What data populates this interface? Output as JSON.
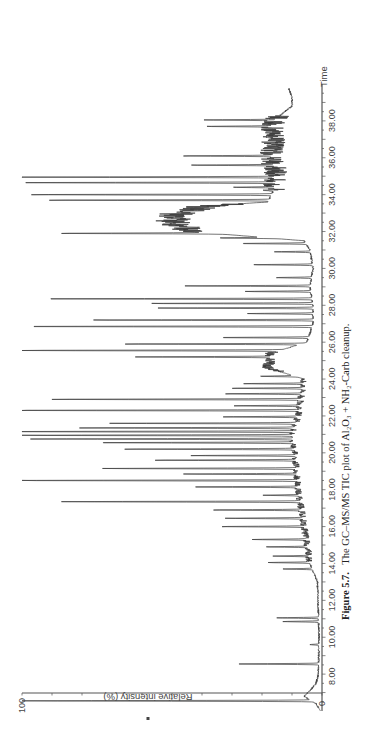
{
  "figure": {
    "caption_label": "Figure 5.7.",
    "caption_text": "The GC–MS/MS TIC plot of Al₂O₃ + NH₂-Carb cleanup."
  },
  "chart_data": {
    "type": "line",
    "xlabel": "Time",
    "ylabel": "Relative intensity (%)",
    "orientation": "rotated 90° counter-clockwise (time axis vertical, increasing upward; intensity increasing leftward)",
    "xlim": [
      6.0,
      40.0
    ],
    "ylim": [
      0,
      100
    ],
    "x_ticks": [
      "8.00",
      "10.00",
      "12.00",
      "14.00",
      "16.00",
      "18.00",
      "20.00",
      "22.00",
      "24.00",
      "26.00",
      "28.00",
      "30.00",
      "32.00",
      "34.00",
      "36.00",
      "38.00"
    ],
    "y_ticks": [
      "0",
      "100"
    ],
    "grid": false,
    "legend": null,
    "peaks": [
      {
        "t": 6.55,
        "h": 99
      },
      {
        "t": 8.55,
        "h": 28
      },
      {
        "t": 9.6,
        "h": 3
      },
      {
        "t": 10.85,
        "h": 12
      },
      {
        "t": 11.05,
        "h": 14
      },
      {
        "t": 13.7,
        "h": 10
      },
      {
        "t": 14.05,
        "h": 14
      },
      {
        "t": 14.4,
        "h": 12
      },
      {
        "t": 14.9,
        "h": 14
      },
      {
        "t": 15.3,
        "h": 18
      },
      {
        "t": 16.0,
        "h": 28
      },
      {
        "t": 16.45,
        "h": 26
      },
      {
        "t": 16.9,
        "h": 30
      },
      {
        "t": 17.35,
        "h": 80
      },
      {
        "t": 17.7,
        "h": 12
      },
      {
        "t": 18.15,
        "h": 36
      },
      {
        "t": 18.5,
        "h": 96
      },
      {
        "t": 18.85,
        "h": 38
      },
      {
        "t": 19.15,
        "h": 65
      },
      {
        "t": 19.6,
        "h": 48
      },
      {
        "t": 19.85,
        "h": 35
      },
      {
        "t": 20.2,
        "h": 58
      },
      {
        "t": 20.55,
        "h": 67
      },
      {
        "t": 20.75,
        "h": 88
      },
      {
        "t": 20.95,
        "h": 95
      },
      {
        "t": 21.15,
        "h": 100
      },
      {
        "t": 21.35,
        "h": 72
      },
      {
        "t": 21.6,
        "h": 62
      },
      {
        "t": 21.95,
        "h": 25
      },
      {
        "t": 22.3,
        "h": 100
      },
      {
        "t": 22.55,
        "h": 22
      },
      {
        "t": 22.9,
        "h": 85
      },
      {
        "t": 23.2,
        "h": 26
      },
      {
        "t": 23.5,
        "h": 24
      },
      {
        "t": 23.75,
        "h": 20
      },
      {
        "t": 24.15,
        "h": 12
      },
      {
        "t": 25.2,
        "h": 45
      },
      {
        "t": 25.55,
        "h": 92
      },
      {
        "t": 25.9,
        "h": 60
      },
      {
        "t": 26.25,
        "h": 30
      },
      {
        "t": 26.85,
        "h": 98
      },
      {
        "t": 27.2,
        "h": 75
      },
      {
        "t": 27.55,
        "h": 22
      },
      {
        "t": 27.85,
        "h": 52
      },
      {
        "t": 28.1,
        "h": 55
      },
      {
        "t": 28.35,
        "h": 92
      },
      {
        "t": 28.75,
        "h": 22
      },
      {
        "t": 29.05,
        "h": 42
      },
      {
        "t": 29.5,
        "h": 12
      },
      {
        "t": 30.2,
        "h": 20
      },
      {
        "t": 30.9,
        "h": 12
      },
      {
        "t": 31.35,
        "h": 22
      },
      {
        "t": 31.65,
        "h": 17
      },
      {
        "t": 31.9,
        "h": 52
      },
      {
        "t": 33.7,
        "h": 75
      },
      {
        "t": 34.0,
        "h": 82
      },
      {
        "t": 34.4,
        "h": 14
      },
      {
        "t": 34.65,
        "h": 88
      },
      {
        "t": 34.95,
        "h": 92
      },
      {
        "t": 35.6,
        "h": 28
      },
      {
        "t": 36.1,
        "h": 30
      },
      {
        "t": 37.7,
        "h": 22
      },
      {
        "t": 38.05,
        "h": 24
      }
    ],
    "baseline": [
      {
        "t": 6.0,
        "h": 0.5
      },
      {
        "t": 6.4,
        "h": 2
      },
      {
        "t": 6.8,
        "h": 6
      },
      {
        "t": 7.1,
        "h": 4
      },
      {
        "t": 7.5,
        "h": 2
      },
      {
        "t": 8.0,
        "h": 1.2
      },
      {
        "t": 10.0,
        "h": 1.0
      },
      {
        "t": 13.0,
        "h": 1.5
      },
      {
        "t": 14.0,
        "h": 4
      },
      {
        "t": 16.0,
        "h": 6
      },
      {
        "t": 18.0,
        "h": 8
      },
      {
        "t": 20.0,
        "h": 9
      },
      {
        "t": 21.0,
        "h": 10
      },
      {
        "t": 22.0,
        "h": 8
      },
      {
        "t": 23.0,
        "h": 7
      },
      {
        "t": 24.0,
        "h": 6
      },
      {
        "t": 24.6,
        "h": 18
      },
      {
        "t": 25.4,
        "h": 17
      },
      {
        "t": 26.0,
        "h": 5
      },
      {
        "t": 27.0,
        "h": 3
      },
      {
        "t": 28.0,
        "h": 3
      },
      {
        "t": 29.0,
        "h": 4
      },
      {
        "t": 30.0,
        "h": 3
      },
      {
        "t": 31.0,
        "h": 4
      },
      {
        "t": 31.5,
        "h": 6
      },
      {
        "t": 32.0,
        "h": 44
      },
      {
        "t": 32.5,
        "h": 50
      },
      {
        "t": 33.0,
        "h": 48
      },
      {
        "t": 33.4,
        "h": 38
      },
      {
        "t": 33.6,
        "h": 18
      },
      {
        "t": 34.3,
        "h": 16
      },
      {
        "t": 35.0,
        "h": 15
      },
      {
        "t": 36.0,
        "h": 17
      },
      {
        "t": 37.0,
        "h": 16
      },
      {
        "t": 37.8,
        "h": 17
      },
      {
        "t": 38.3,
        "h": 14
      },
      {
        "t": 38.8,
        "h": 10
      },
      {
        "t": 39.3,
        "h": 10
      },
      {
        "t": 39.7,
        "h": 11
      }
    ],
    "noisy_regions": [
      {
        "start": 32.0,
        "end": 33.5,
        "amplitude": 6
      },
      {
        "start": 34.2,
        "end": 38.3,
        "amplitude": 4
      },
      {
        "start": 24.4,
        "end": 25.5,
        "amplitude": 2
      },
      {
        "start": 14.0,
        "end": 24.0,
        "amplitude": 1.2
      }
    ]
  },
  "layout": {
    "time_axis_x": 322,
    "time_min": 6.0,
    "time_min_y": 711,
    "time_max": 40.0,
    "time_max_y": 84,
    "intensity_zero_x": 322,
    "intensity_full_x": 22,
    "intensity_axis_y": 693
  }
}
